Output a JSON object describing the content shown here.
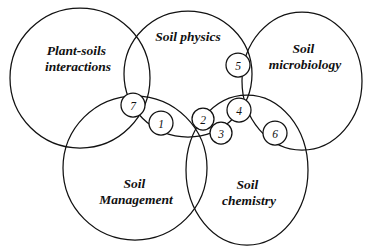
{
  "diagram": {
    "type": "venn",
    "title": "",
    "background_color": "#ffffff",
    "stroke_color": "#111111",
    "sets": [
      {
        "id": "plant-soils-interactions",
        "label_line1": "Plant-soils",
        "label_line2": "interactions",
        "shape": "circle",
        "cx": 80,
        "cy": 78,
        "rx": 70,
        "ry": 70,
        "label_x": 78,
        "label_y": 52
      },
      {
        "id": "soil-physics",
        "label_line1": "Soil physics",
        "label_line2": "",
        "shape": "ellipse",
        "cx": 188,
        "cy": 74,
        "rx": 64,
        "ry": 63,
        "label_x": 188,
        "label_y": 38
      },
      {
        "id": "soil-microbiology",
        "label_line1": "Soil",
        "label_line2": "microbiology",
        "shape": "circle",
        "cx": 302,
        "cy": 81,
        "rx": 60,
        "ry": 69,
        "label_x": 305,
        "label_y": 50
      },
      {
        "id": "soil-management",
        "label_line1": "Soil",
        "label_line2": "Management",
        "shape": "circle",
        "cx": 135,
        "cy": 168,
        "rx": 72,
        "ry": 72,
        "label_x": 136,
        "label_y": 185
      },
      {
        "id": "soil-chemistry",
        "label_line1": "Soil",
        "label_line2": "chemistry",
        "shape": "circle",
        "cx": 247,
        "cy": 170,
        "rx": 61,
        "ry": 75,
        "label_x": 249,
        "label_y": 186
      }
    ],
    "regions": [
      {
        "id": "region-1",
        "number": "1",
        "cx": 161,
        "cy": 123,
        "r": 12
      },
      {
        "id": "region-2",
        "number": "2",
        "cx": 203,
        "cy": 119,
        "r": 11
      },
      {
        "id": "region-3",
        "number": "3",
        "cx": 221,
        "cy": 133,
        "r": 11
      },
      {
        "id": "region-4",
        "number": "4",
        "cx": 239,
        "cy": 110,
        "r": 12
      },
      {
        "id": "region-5",
        "number": "5",
        "cx": 238,
        "cy": 65,
        "r": 12
      },
      {
        "id": "region-6",
        "number": "6",
        "cx": 275,
        "cy": 133,
        "r": 12
      },
      {
        "id": "region-7",
        "number": "7",
        "cx": 133,
        "cy": 105,
        "r": 12
      }
    ]
  }
}
